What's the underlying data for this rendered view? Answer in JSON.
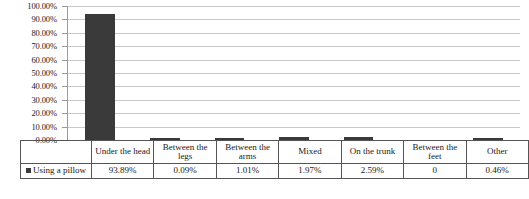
{
  "chart_data": {
    "type": "bar",
    "title": "",
    "xlabel": "",
    "ylabel": "",
    "ylim": [
      0,
      100
    ],
    "grid": true,
    "legend_position": "table-row-header",
    "categories": [
      "Under the head",
      "Between the legs",
      "Between the arms",
      "Mixed",
      "On the trunk",
      "Between the feet",
      "Other"
    ],
    "series": [
      {
        "name": "Using a pillow",
        "values": [
          93.89,
          0.09,
          1.01,
          1.97,
          2.59,
          0,
          0.46
        ],
        "value_labels": [
          "93.89%",
          "0.09%",
          "1.01%",
          "1.97%",
          "2.59%",
          "0",
          "0.46%"
        ],
        "color": "#3a3a3a"
      }
    ],
    "y_ticks": [
      "0.00%",
      "10.00%",
      "20.00%",
      "30.00%",
      "40.00%",
      "50.00%",
      "60.00%",
      "70.00%",
      "80.00%",
      "90.00%",
      "100.00%"
    ]
  },
  "legend": {
    "series_label": "Using a pillow",
    "swatch_color": "#3a3a3a"
  },
  "colors": {
    "bar": "#3a3a3a",
    "gridline": "#c9c9c9",
    "axis": "#9a9a9a",
    "table_border": "#555555",
    "background": "#ffffff",
    "text": "#1a1a1a"
  }
}
